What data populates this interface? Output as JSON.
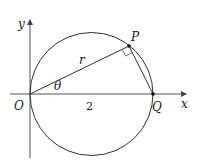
{
  "diagram": {
    "title": "",
    "axes": {
      "x_label": "x",
      "y_label": "y"
    },
    "points": {
      "O": {
        "label": "O"
      },
      "P": {
        "label": "P"
      },
      "Q": {
        "label": "Q"
      }
    },
    "labels": {
      "radius": "r",
      "angle": "θ",
      "segment_OQ": "2"
    },
    "colors": {
      "stroke": "#333333",
      "axis": "#555555",
      "background": "#ffffff"
    }
  }
}
